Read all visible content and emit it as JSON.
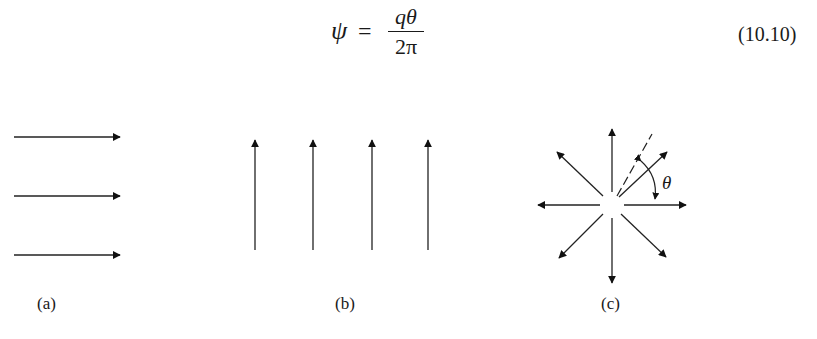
{
  "equation": {
    "lhs": "ψ",
    "equals": "=",
    "numerator": "qθ",
    "denominator": "2π",
    "number": "(10.10)"
  },
  "figure": {
    "panels": [
      {
        "id": "a",
        "label": "(a)",
        "description": "uniform flow, horizontal parallel arrows",
        "arrow_count": 3,
        "direction": "right"
      },
      {
        "id": "b",
        "label": "(b)",
        "description": "uniform flow, vertical parallel arrows",
        "arrow_count": 4,
        "direction": "up"
      },
      {
        "id": "c",
        "label": "(c)",
        "description": "point source, radial arrows",
        "arrow_count": 8,
        "direction": "outward",
        "angle_symbol": "θ"
      }
    ]
  }
}
